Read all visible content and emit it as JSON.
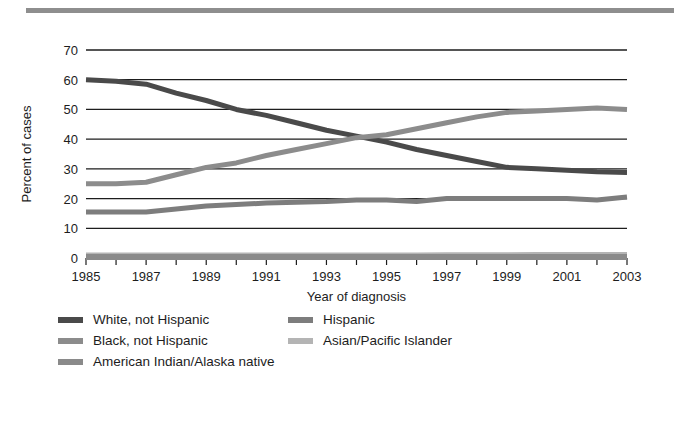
{
  "figure": {
    "background_color": "#ffffff",
    "top_rule_color": "#8e8e8e"
  },
  "chart_data": {
    "type": "line",
    "title": "",
    "subtitle": "",
    "xlabel": "Year of diagnosis",
    "ylabel": "Percent of cases",
    "xlim": [
      1985,
      2003
    ],
    "ylim": [
      0,
      70
    ],
    "ytick_values": [
      0,
      10,
      20,
      30,
      40,
      50,
      60,
      70
    ],
    "ytick_labels": [
      "0",
      "10",
      "20",
      "30",
      "40",
      "50",
      "60",
      "70"
    ],
    "xtick_values": [
      1985,
      1986,
      1987,
      1988,
      1989,
      1990,
      1991,
      1992,
      1993,
      1994,
      1995,
      1996,
      1997,
      1998,
      1999,
      2000,
      2001,
      2002,
      2003
    ],
    "xtick_labels": [
      "1985",
      "",
      "1987",
      "",
      "1989",
      "",
      "1991",
      "",
      "1993",
      "",
      "1995",
      "",
      "1997",
      "",
      "1999",
      "",
      "2001",
      "",
      "2003"
    ],
    "xtick_labels_shown": [
      "1985",
      "1987",
      "1989",
      "1991",
      "1993",
      "1995",
      "1997",
      "1999",
      "2001",
      "2003"
    ],
    "grid": "horizontal",
    "legend_position": "below-axes",
    "x": [
      1985,
      1986,
      1987,
      1988,
      1989,
      1990,
      1991,
      1992,
      1993,
      1994,
      1995,
      1996,
      1997,
      1998,
      1999,
      2000,
      2001,
      2002,
      2003
    ],
    "series": [
      {
        "name": "White, not Hispanic",
        "color": "#4a4a4a",
        "values": [
          60.0,
          59.5,
          58.5,
          55.5,
          53.0,
          50.0,
          48.0,
          45.5,
          43.0,
          41.0,
          39.0,
          36.5,
          34.5,
          32.5,
          30.5,
          30.0,
          29.5,
          29.0,
          28.8
        ]
      },
      {
        "name": "Black, not Hispanic",
        "color": "#8c8c8c",
        "values": [
          25.0,
          25.0,
          25.5,
          28.0,
          30.5,
          32.0,
          34.5,
          36.5,
          38.5,
          40.5,
          41.5,
          43.5,
          45.5,
          47.5,
          49.0,
          49.5,
          50.0,
          50.5,
          50.0
        ]
      },
      {
        "name": "Hispanic",
        "color": "#7d7d7d",
        "values": [
          15.5,
          15.5,
          15.5,
          16.5,
          17.5,
          18.0,
          18.5,
          18.8,
          19.0,
          19.5,
          19.5,
          19.0,
          20.0,
          20.0,
          20.0,
          20.0,
          20.0,
          19.5,
          20.5
        ]
      },
      {
        "name": "Asian/Pacific Islander",
        "color": "#b4b4b4",
        "values": [
          0.8,
          0.8,
          0.8,
          0.8,
          0.8,
          0.8,
          0.8,
          0.8,
          0.8,
          0.8,
          0.8,
          0.8,
          0.9,
          0.9,
          0.9,
          1.0,
          1.0,
          1.0,
          1.0
        ]
      },
      {
        "name": "American Indian/Alaska native",
        "color": "#8a8a8a",
        "values": [
          0.3,
          0.3,
          0.3,
          0.3,
          0.3,
          0.3,
          0.3,
          0.3,
          0.3,
          0.3,
          0.3,
          0.3,
          0.3,
          0.3,
          0.3,
          0.3,
          0.3,
          0.3,
          0.3
        ]
      }
    ]
  },
  "legend": {
    "rows": [
      [
        {
          "label": "White, not Hispanic",
          "color": "#4a4a4a"
        },
        {
          "label": "Hispanic",
          "color": "#7d7d7d"
        }
      ],
      [
        {
          "label": "Black, not Hispanic",
          "color": "#8c8c8c"
        },
        {
          "label": "Asian/Pacific Islander",
          "color": "#b4b4b4"
        }
      ],
      [
        {
          "label": "American Indian/Alaska native",
          "color": "#8a8a8a"
        }
      ]
    ]
  }
}
